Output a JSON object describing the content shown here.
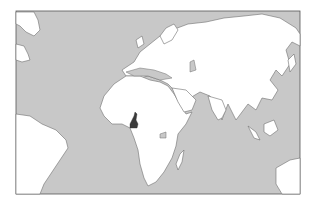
{
  "map": {
    "title": "Location of Cameroon",
    "highlighted_country": "Cameroon",
    "colors": {
      "ocean": "#c8c8c8",
      "land": "#ffffff",
      "coast": "#6e6e6e",
      "highlight": "#3a3a3a",
      "frame": "#555555",
      "background": "#ffffff"
    },
    "regions_shown": [
      "Europe",
      "Africa",
      "Asia",
      "South America (partial)",
      "North America (partial)",
      "Australia (partial)"
    ]
  }
}
